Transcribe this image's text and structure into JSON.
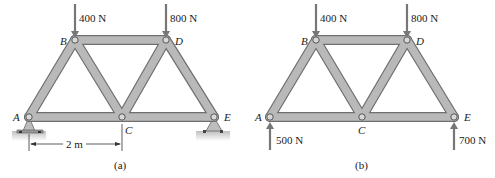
{
  "figure_a": {
    "caption": "(a)",
    "joints": {
      "A": "A",
      "B": "B",
      "C": "C",
      "D": "D",
      "E": "E"
    },
    "loads": [
      {
        "joint": "B",
        "label": "400 N",
        "direction": "down"
      },
      {
        "joint": "D",
        "label": "800 N",
        "direction": "down"
      }
    ],
    "supports": [
      {
        "joint": "A",
        "type": "pin"
      },
      {
        "joint": "E",
        "type": "roller"
      }
    ],
    "dimension": {
      "from": "A",
      "to": "C",
      "label": "2 m"
    }
  },
  "figure_b": {
    "caption": "(b)",
    "joints": {
      "A": "A",
      "B": "B",
      "C": "C",
      "D": "D",
      "E": "E"
    },
    "loads": [
      {
        "joint": "B",
        "label": "400 N",
        "direction": "down"
      },
      {
        "joint": "D",
        "label": "800 N",
        "direction": "down"
      },
      {
        "joint": "A",
        "label": "500 N",
        "direction": "up"
      },
      {
        "joint": "E",
        "label": "700 N",
        "direction": "up"
      }
    ]
  },
  "colors": {
    "member_fill": "#b9b9b9",
    "member_edge": "#6f6f6f",
    "arrow": "#777777",
    "ground": "#cfcfcf"
  }
}
